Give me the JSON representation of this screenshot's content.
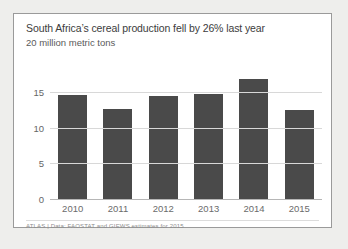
{
  "card": {
    "title": "South Africa’s cereal production fell by 26% last year",
    "subtitle": "20 million metric tons",
    "footer": "ATLAS | Data: FAOSTAT and GIEWS estimates for 2015"
  },
  "colors": {
    "bar": "#4a4a4a",
    "gridline": "#d8d8d8",
    "axis": "#b6b6b6",
    "card_border": "#9a9a9a",
    "card_background": "#ffffff",
    "page_background": "#eeeeec",
    "title_text": "#3c3c3c",
    "subtitle_text": "#5a5a5a",
    "tick_text": "#666666",
    "footer_text": "#8d8d8d"
  },
  "chart_data": {
    "type": "bar",
    "title": "South Africa’s cereal production fell by 26% last year",
    "subtitle": "20 million metric tons",
    "categories": [
      "2010",
      "2011",
      "2012",
      "2013",
      "2014",
      "2015"
    ],
    "values": [
      14.7,
      12.8,
      14.6,
      14.9,
      17.0,
      12.6
    ],
    "xlabel": "",
    "ylabel": "",
    "ylim": [
      0,
      17.8
    ],
    "yticks": [
      0,
      5,
      10,
      15
    ],
    "ytick_labels": [
      "0",
      "5",
      "10",
      "15"
    ],
    "grid": true,
    "legend": "none",
    "annotation": "ATLAS | Data: FAOSTAT and GIEWS estimates for 2015"
  }
}
